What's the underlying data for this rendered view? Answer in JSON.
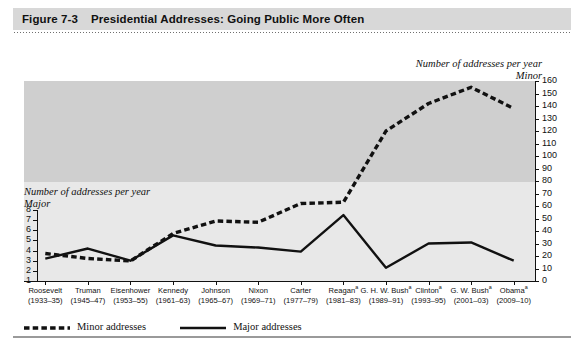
{
  "header": {
    "figure_number": "Figure 7-3",
    "title": "Presidential Addresses: Going Public More Often"
  },
  "axis_captions": {
    "right_line1": "Number of addresses per year",
    "right_line2": "Minor",
    "left_line1": "Number of addresses per year",
    "left_line2": "Major"
  },
  "legend": {
    "items": [
      {
        "label": "Minor addresses",
        "style": "dashed",
        "color": "#111111"
      },
      {
        "label": "Major addresses",
        "style": "solid",
        "color": "#111111"
      }
    ]
  },
  "chart_data": {
    "type": "line",
    "title": "Presidential Addresses: Going Public More Often",
    "xlabel": "",
    "ylabel": "Major",
    "y2label": "Minor",
    "grid": false,
    "legend_position": "bottom-left",
    "categories": [
      "Roosevelt",
      "Truman",
      "Eisenhower",
      "Kennedy",
      "Johnson",
      "Nixon",
      "Carter",
      "Reagan",
      "G. H. W. Bush",
      "Clinton",
      "G. W. Bush",
      "Obama"
    ],
    "category_years": [
      "(1933–35)",
      "(1945–47)",
      "(1953–55)",
      "(1961–63)",
      "(1965–67)",
      "(1969–71)",
      "(1977–79)",
      "(1981–83)",
      "(1989–91)",
      "(1993–95)",
      "(2001–03)",
      "(2009–10)"
    ],
    "category_footnote_marks": [
      "",
      "",
      "",
      "",
      "",
      "",
      "",
      "a",
      "a",
      "a",
      "a",
      "a"
    ],
    "ylim": [
      1,
      8
    ],
    "yticks": [
      1,
      2,
      3,
      4,
      5,
      6,
      7,
      8
    ],
    "y2lim": [
      0,
      160
    ],
    "y2ticks": [
      0,
      10,
      20,
      30,
      40,
      50,
      60,
      70,
      80,
      90,
      100,
      110,
      120,
      130,
      140,
      150,
      160
    ],
    "shaded_band": {
      "axis": "minor",
      "from": 80,
      "to": 160,
      "color": "#cfcfcf"
    },
    "plot_background": "#e8e8e8",
    "series": [
      {
        "name": "Major addresses",
        "axis": "left",
        "style": "solid",
        "color": "#111111",
        "values": [
          3.2,
          4.2,
          3.0,
          5.5,
          4.5,
          4.3,
          3.9,
          7.5,
          2.3,
          4.7,
          4.8,
          3.0
        ]
      },
      {
        "name": "Minor addresses",
        "axis": "right",
        "style": "dashed",
        "color": "#111111",
        "values": [
          22,
          18,
          16,
          38,
          48,
          47,
          62,
          63,
          120,
          142,
          155,
          138
        ]
      }
    ]
  }
}
